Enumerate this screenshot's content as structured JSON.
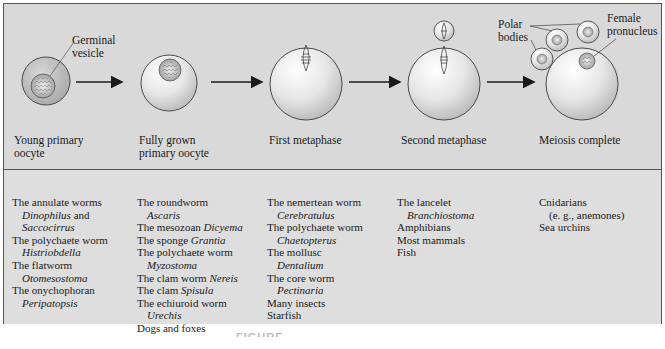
{
  "colors": {
    "panel_bg": "#d9d9d9",
    "border": "#555555",
    "cell_fill": "#efefef",
    "cell_outline": "#4a4a4a",
    "arrow": "#1a1a1a"
  },
  "stages": [
    {
      "label_line1": "Young primary",
      "label_line2": "oocyte"
    },
    {
      "label_line1": "Fully grown",
      "label_line2": "primary oocyte"
    },
    {
      "label_line1": "First metaphase",
      "label_line2": ""
    },
    {
      "label_line1": "Second metaphase",
      "label_line2": ""
    },
    {
      "label_line1": "Meiosis complete",
      "label_line2": ""
    }
  ],
  "callouts": {
    "germinal_vesicle_1": "Germinal",
    "germinal_vesicle_2": "vesicle",
    "polar_bodies_1": "Polar",
    "polar_bodies_2": "bodies",
    "female_pronucleus_1": "Female",
    "female_pronucleus_2": "pronucleus"
  },
  "columns": [
    {
      "lines": [
        {
          "text": "The annulate worms",
          "indent": false,
          "italic": false
        },
        {
          "text": "Dinophilus",
          "suffix": " and",
          "indent": true,
          "italic": true
        },
        {
          "text": "Saccocirrus",
          "indent": true,
          "italic": true
        },
        {
          "text": "The polychaete worm",
          "indent": false,
          "italic": false
        },
        {
          "text": "Histriobdella",
          "indent": true,
          "italic": true
        },
        {
          "text": "The flatworm",
          "indent": false,
          "italic": false
        },
        {
          "text": "Otomesostoma",
          "indent": true,
          "italic": true
        },
        {
          "text": "The onychophoran",
          "indent": false,
          "italic": false
        },
        {
          "text": "Peripatopsis",
          "indent": true,
          "italic": true
        }
      ]
    },
    {
      "lines": [
        {
          "text": "The roundworm",
          "indent": false,
          "italic": false
        },
        {
          "text": "Ascaris",
          "indent": true,
          "italic": true
        },
        {
          "prefix": "The mesozoan ",
          "text": "Dicyema",
          "indent": false,
          "italic": true
        },
        {
          "prefix": "The sponge ",
          "text": "Grantia",
          "indent": false,
          "italic": true
        },
        {
          "text": "The polychaete worm",
          "indent": false,
          "italic": false
        },
        {
          "text": "Myzostoma",
          "indent": true,
          "italic": true
        },
        {
          "prefix": "The clam worm ",
          "text": "Nereis",
          "indent": false,
          "italic": true
        },
        {
          "prefix": "The clam ",
          "text": "Spisula",
          "indent": false,
          "italic": true
        },
        {
          "text": "The echiuroid worm",
          "indent": false,
          "italic": false
        },
        {
          "text": "Urechis",
          "indent": true,
          "italic": true
        },
        {
          "text": "Dogs and foxes",
          "indent": false,
          "italic": false
        }
      ]
    },
    {
      "lines": [
        {
          "text": "The nemertean worm",
          "indent": false,
          "italic": false
        },
        {
          "text": "Cerebratulus",
          "indent": true,
          "italic": true
        },
        {
          "text": "The polychaete worm",
          "indent": false,
          "italic": false
        },
        {
          "text": "Chaetopterus",
          "indent": true,
          "italic": true
        },
        {
          "text": "The mollusc",
          "indent": false,
          "italic": false
        },
        {
          "text": "Dentalium",
          "indent": true,
          "italic": true
        },
        {
          "text": "The core worm",
          "indent": false,
          "italic": false
        },
        {
          "text": "Pectinaria",
          "indent": true,
          "italic": true
        },
        {
          "text": "Many insects",
          "indent": false,
          "italic": false
        },
        {
          "text": "Starfish",
          "indent": false,
          "italic": false
        }
      ]
    },
    {
      "lines": [
        {
          "text": "The lancelet",
          "indent": false,
          "italic": false
        },
        {
          "text": "Branchiostoma",
          "indent": true,
          "italic": true
        },
        {
          "text": "Amphibians",
          "indent": false,
          "italic": false
        },
        {
          "text": "Most mammals",
          "indent": false,
          "italic": false
        },
        {
          "text": "Fish",
          "indent": false,
          "italic": false
        }
      ]
    },
    {
      "lines": [
        {
          "text": "Cnidarians",
          "indent": false,
          "italic": false
        },
        {
          "text": "(e. g., anemones)",
          "indent": true,
          "italic": false
        },
        {
          "text": "Sea urchins",
          "indent": false,
          "italic": false
        }
      ]
    }
  ],
  "caption": "FIGURE"
}
